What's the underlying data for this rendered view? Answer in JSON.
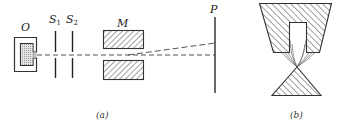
{
  "figure_a": {
    "caption": "(a)",
    "labels": {
      "oven": "O",
      "slit1_base": "S",
      "slit1_sub": "1",
      "slit2_base": "S",
      "slit2_sub": "2",
      "magnet": "M",
      "plate": "P"
    }
  },
  "figure_b": {
    "caption": "(b)"
  },
  "colors": {
    "ink": "#333333",
    "stipple": "#cfcfcf",
    "background": "#ffffff"
  }
}
